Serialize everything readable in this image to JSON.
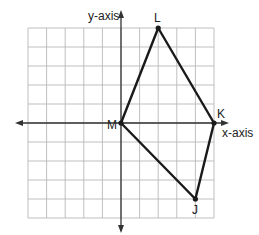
{
  "diagram": {
    "type": "coordinate-plane",
    "grid": {
      "x_min": -5,
      "x_max": 5,
      "y_min": -5,
      "y_max": 5,
      "step": 1
    },
    "axes": {
      "x_label": "x-axis",
      "y_label": "y-axis"
    },
    "polygon": {
      "vertices": [
        {
          "name": "M",
          "x": 0,
          "y": 0
        },
        {
          "name": "L",
          "x": 2,
          "y": 5
        },
        {
          "name": "K",
          "x": 5,
          "y": 0
        },
        {
          "name": "J",
          "x": 4,
          "y": -4
        }
      ],
      "order": [
        "M",
        "L",
        "K",
        "J"
      ]
    },
    "colors": {
      "grid": "#b8b8b8",
      "axis": "#333333",
      "polygon": "#1a1a1a"
    }
  },
  "labels": {
    "x_axis": "x-axis",
    "y_axis": "y-axis",
    "M": "M",
    "L": "L",
    "K": "K",
    "J": "J"
  }
}
